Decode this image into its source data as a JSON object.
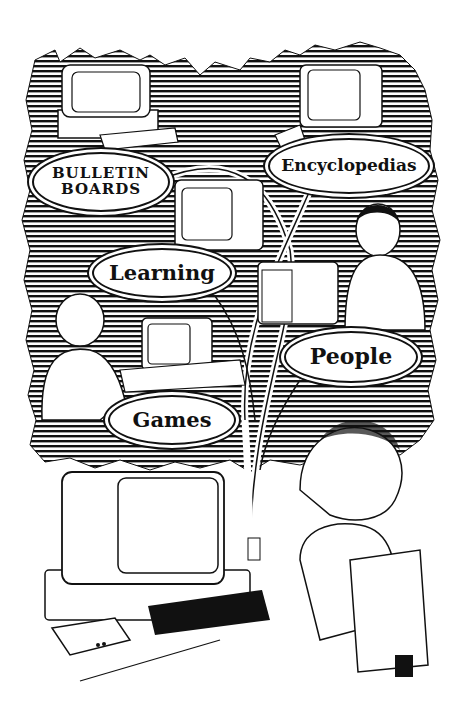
{
  "illustration": {
    "subject": "People using computers connected by network lines to online services",
    "style": "black-and-white line art with hatched foliage background",
    "background_color": "#ffffff",
    "ink_color": "#111111"
  },
  "labels": {
    "bulletin_boards": [
      "BULLETIN",
      "BOARDS"
    ],
    "encyclopedias": "Encyclopedias",
    "learning": "Learning",
    "people": "People",
    "games": "Games"
  }
}
